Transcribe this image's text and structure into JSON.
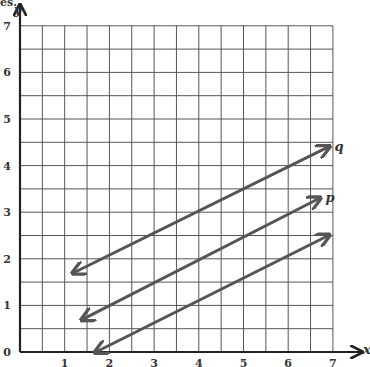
{
  "chart_data": {
    "type": "line",
    "title": "",
    "xlabel": "x",
    "ylabel": "y",
    "xlim": [
      0,
      7
    ],
    "ylim": [
      0,
      7
    ],
    "grid": true,
    "grid_step": 0.5,
    "x_ticks": [
      "1",
      "2",
      "3",
      "4",
      "5",
      "6",
      "7"
    ],
    "y_ticks": [
      "0",
      "1",
      "2",
      "3",
      "4",
      "5",
      "6",
      "7"
    ],
    "series": [
      {
        "name": "q",
        "label": "q",
        "points": [
          [
            1.2,
            1.7
          ],
          [
            6.9,
            4.4
          ]
        ]
      },
      {
        "name": "p",
        "label": "p",
        "points": [
          [
            1.4,
            0.7
          ],
          [
            6.7,
            3.3
          ]
        ]
      },
      {
        "name": "unlabeled",
        "label": "",
        "points": [
          [
            1.7,
            0.0
          ],
          [
            6.9,
            2.5
          ]
        ]
      }
    ],
    "line_color": "#555555",
    "grid_color": "#555555"
  },
  "labels": {
    "x_axis": "x",
    "y_axis": "y",
    "q": "q",
    "p": "p",
    "origin": "0",
    "top_fragment": "es."
  }
}
